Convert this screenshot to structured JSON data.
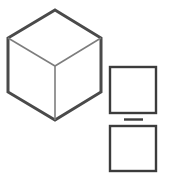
{
  "canvas": {
    "width": 172,
    "height": 179,
    "background_color": "#ffffff"
  },
  "palette": {
    "outline_color": "#4a4a4a",
    "inner_edge_color": "#7d7d7d",
    "square_stroke_color": "#3c3c3c",
    "dash_color": "#3c3c3c",
    "fill_color": "#ffffff"
  },
  "shapes": {
    "cube": {
      "label": "isometric-cube",
      "outline_points": "55,10 101,38 101,92 55,120 8,92 8,38",
      "outline_stroke_width": 3,
      "center_vertex": {
        "x": 55,
        "y": 66
      },
      "inner_edges": [
        {
          "label": "edge-center-to-upper-left",
          "x1": 55,
          "y1": 66,
          "x2": 8,
          "y2": 38
        },
        {
          "label": "edge-center-to-upper-right",
          "x1": 55,
          "y1": 66,
          "x2": 101,
          "y2": 38
        },
        {
          "label": "edge-center-to-bottom",
          "x1": 55,
          "y1": 66,
          "x2": 55,
          "y2": 120
        }
      ],
      "inner_stroke_width": 1.6
    },
    "square_top": {
      "label": "square-top",
      "x": 110,
      "y": 67,
      "width": 46,
      "height": 46,
      "stroke_width": 2.4
    },
    "square_bottom": {
      "label": "square-bottom",
      "x": 110,
      "y": 126,
      "width": 46,
      "height": 45,
      "stroke_width": 2.4
    },
    "dash": {
      "label": "separator-dash",
      "x1": 124,
      "y1": 119.5,
      "x2": 143,
      "y2": 119.5,
      "stroke_width": 2.4
    }
  }
}
